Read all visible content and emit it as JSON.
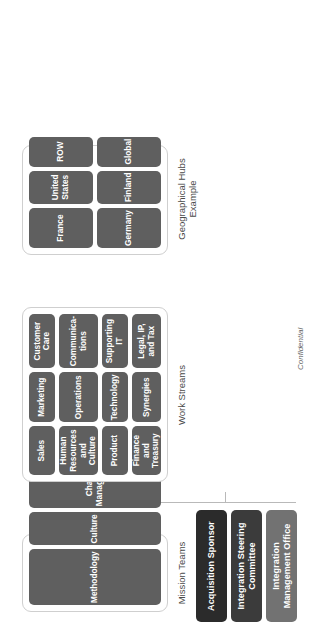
{
  "document": {
    "title": "Integration Governance Structure",
    "footer_note": "Confidential"
  },
  "leadership": {
    "boxes": [
      {
        "label": "Acquisition Sponsor",
        "color": "#2b2b2b"
      },
      {
        "label": "Integration Steering Committee",
        "color": "#3b3b3b"
      },
      {
        "label": "Integration Management Office",
        "color": "#727272"
      }
    ]
  },
  "groups": [
    {
      "id": "mission",
      "label": "Mission Teams",
      "columns": 3,
      "rows": 1,
      "nodes": [
        {
          "label": "Methodology"
        },
        {
          "label": "Culture"
        },
        {
          "label": "Change Management"
        }
      ]
    },
    {
      "id": "work",
      "label": "Work Streams",
      "columns": 3,
      "rows": 4,
      "nodes": [
        {
          "label": "Sales"
        },
        {
          "label": "Marketing"
        },
        {
          "label": "Customer Care"
        },
        {
          "label": "Human Resources and Culture"
        },
        {
          "label": "Operations"
        },
        {
          "label": "Communica-tions"
        },
        {
          "label": "Product"
        },
        {
          "label": "Technology"
        },
        {
          "label": "Supporting IT"
        },
        {
          "label": "Finance and Treasury"
        },
        {
          "label": "Synergies"
        },
        {
          "label": "Legal, IP, and Tax"
        }
      ]
    },
    {
      "id": "geo",
      "label": "Geographical Hubs Example",
      "columns": 3,
      "rows": 2,
      "nodes": [
        {
          "label": "France"
        },
        {
          "label": "United States"
        },
        {
          "label": "ROW"
        },
        {
          "label": "Germany"
        },
        {
          "label": "Finland"
        },
        {
          "label": "Global"
        }
      ]
    }
  ],
  "colors": {
    "node_fill": "#5f5f5f",
    "group_border": "#cfcfcf",
    "connector": "#b9b9b9",
    "label_text": "#4a4a4a",
    "page_background": "#ffffff"
  }
}
